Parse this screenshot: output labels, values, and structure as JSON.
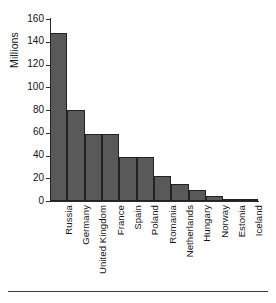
{
  "chart_data": {
    "type": "bar",
    "title": "",
    "subtitle": "",
    "xlabel": "",
    "ylabel": "Millions",
    "ylim": [
      0,
      160
    ],
    "yticks": [
      0,
      20,
      40,
      60,
      80,
      100,
      120,
      140,
      160
    ],
    "ytick_labels": [
      "0",
      "20",
      "40",
      "60",
      "80",
      "100",
      "120",
      "140",
      "160"
    ],
    "grid": false,
    "legend": false,
    "legend_position": "none",
    "orientation": "vertical",
    "categories": [
      "Russia",
      "Germany",
      "United Kingdom",
      "France",
      "Spain",
      "Poland",
      "Romania",
      "Netherlands",
      "Hungary",
      "Norway",
      "Estonia",
      "Iceland"
    ],
    "values": [
      148,
      80,
      59,
      59,
      39,
      39,
      22,
      15,
      10,
      4,
      1.4,
      0.3
    ],
    "bar_color": "#595959",
    "bar_edge_color": "#222222",
    "axis_color": "#2b2b2b",
    "text_color": "#141414",
    "background_color": "#ffffff"
  },
  "figure": {
    "y_axis_title": "Millions"
  }
}
